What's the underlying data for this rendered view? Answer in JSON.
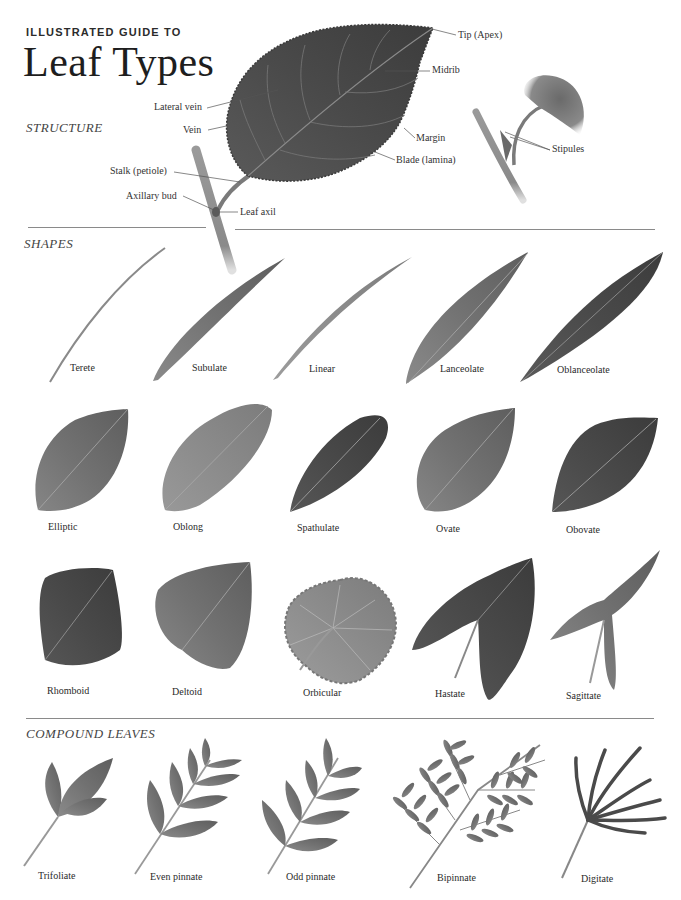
{
  "header": {
    "kicker": "ILLUSTRATED GUIDE TO",
    "title": "Leaf Types"
  },
  "sections": {
    "structure": "STRUCTURE",
    "shapes": "SHAPES",
    "compound": "COMPOUND LEAVES"
  },
  "structure_labels": {
    "tip": "Tip (Apex)",
    "midrib": "Midrib",
    "lateral_vein": "Lateral vein",
    "vein": "Vein",
    "margin": "Margin",
    "blade": "Blade (lamina)",
    "stalk": "Stalk (petiole)",
    "axillary_bud": "Axillary bud",
    "leaf_axil": "Leaf axil",
    "stipules": "Stipules"
  },
  "shapes_row1": [
    "Terete",
    "Subulate",
    "Linear",
    "Lanceolate",
    "Oblanceolate"
  ],
  "shapes_row2": [
    "Elliptic",
    "Oblong",
    "Spathulate",
    "Ovate",
    "Obovate"
  ],
  "shapes_row3": [
    "Rhomboid",
    "Deltoid",
    "Orbicular",
    "Hastate",
    "Sagittate"
  ],
  "compound": [
    "Trifoliate",
    "Even pinnate",
    "Odd pinnate",
    "Bipinnate",
    "Digitate"
  ],
  "colors": {
    "leaf_dark": "#4a4a4a",
    "leaf_mid": "#7a7a7a",
    "leaf_light": "#a8a8a8",
    "rule": "#8a8a8a",
    "text": "#2a2a2a"
  }
}
